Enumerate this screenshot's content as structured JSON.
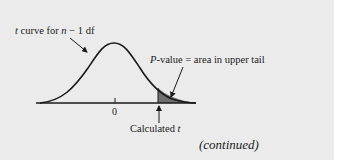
{
  "diagram": {
    "labels": {
      "curve_prefix": "t",
      "curve_mid": " curve for ",
      "curve_n": "n",
      "curve_suffix": " − 1 df",
      "pvalue_p": "P",
      "pvalue_rest": "-value = area in upper tail",
      "zero_tick": "0",
      "calculated_prefix": "Calculated ",
      "calculated_t": "t",
      "continued": "(continued)"
    },
    "colors": {
      "background": "#ebebeb",
      "page": "#ffffff",
      "curve": "#1a1a1a",
      "shaded_tail": "#6f6f6f"
    }
  }
}
